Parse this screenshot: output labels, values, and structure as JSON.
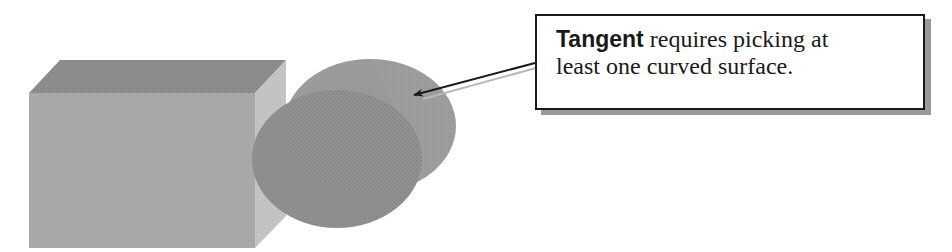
{
  "callout": {
    "keyword": "Tangent",
    "line1_rest": " requires picking at",
    "line2": "least one curved surface."
  },
  "shapes": {
    "box": {
      "top_face_color": "#8c8c8c",
      "front_face_color": "#a9a9a9",
      "side_face_color": "#c4c4c4"
    },
    "cylinder": {
      "front_face_color": "#8e8e8e",
      "body_color": "#9a9a9a"
    }
  },
  "arrow": {
    "color": "#1a1a1a",
    "shadow_color": "#b8b8b8"
  }
}
